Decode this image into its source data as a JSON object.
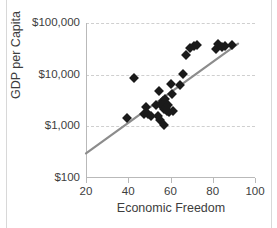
{
  "chart_data": {
    "type": "scatter",
    "title": "and the Pacific",
    "xlabel": "Economic Freedom",
    "ylabel": "GDP per Capita",
    "xlim": [
      20,
      100
    ],
    "ylim": [
      100,
      100000
    ],
    "yscale": "log",
    "xscale": "linear",
    "grid": true,
    "legend": false,
    "xticks": [
      20,
      40,
      60,
      80,
      100
    ],
    "xtick_labels": [
      "20",
      "40",
      "60",
      "80",
      "100"
    ],
    "yticks": [
      100,
      1000,
      10000,
      100000
    ],
    "ytick_labels": [
      "$100",
      "$1,000",
      "$10,000",
      "$100,000"
    ],
    "marker": "diamond",
    "marker_color": "#1a1a1a",
    "trendline_color": "#8c8c8c",
    "trendline": {
      "x_start": 20,
      "y_start": 300,
      "x_end": 92,
      "y_end": 40000
    },
    "points": [
      {
        "x": 39.5,
        "y": 1450
      },
      {
        "x": 42.5,
        "y": 8500
      },
      {
        "x": 47.5,
        "y": 1700
      },
      {
        "x": 48.5,
        "y": 2400
      },
      {
        "x": 49.5,
        "y": 1750
      },
      {
        "x": 51.0,
        "y": 1600
      },
      {
        "x": 53.0,
        "y": 2600
      },
      {
        "x": 54.0,
        "y": 1550
      },
      {
        "x": 54.5,
        "y": 4900
      },
      {
        "x": 55.0,
        "y": 1350
      },
      {
        "x": 55.5,
        "y": 2750
      },
      {
        "x": 56.0,
        "y": 2450
      },
      {
        "x": 56.5,
        "y": 3100
      },
      {
        "x": 57.0,
        "y": 2200
      },
      {
        "x": 57.0,
        "y": 1050
      },
      {
        "x": 57.5,
        "y": 3400
      },
      {
        "x": 58.0,
        "y": 2350
      },
      {
        "x": 58.5,
        "y": 2000
      },
      {
        "x": 59.0,
        "y": 2600
      },
      {
        "x": 59.5,
        "y": 1900
      },
      {
        "x": 60.0,
        "y": 6600
      },
      {
        "x": 60.5,
        "y": 4200
      },
      {
        "x": 61.0,
        "y": 1950
      },
      {
        "x": 64.5,
        "y": 6400
      },
      {
        "x": 66.0,
        "y": 10500
      },
      {
        "x": 67.5,
        "y": 24000
      },
      {
        "x": 69.0,
        "y": 33000
      },
      {
        "x": 71.0,
        "y": 36000
      },
      {
        "x": 72.5,
        "y": 37000
      },
      {
        "x": 81.5,
        "y": 32000
      },
      {
        "x": 82.5,
        "y": 39000
      },
      {
        "x": 84.5,
        "y": 35000
      },
      {
        "x": 86.0,
        "y": 35500
      },
      {
        "x": 89.0,
        "y": 38000
      }
    ]
  }
}
